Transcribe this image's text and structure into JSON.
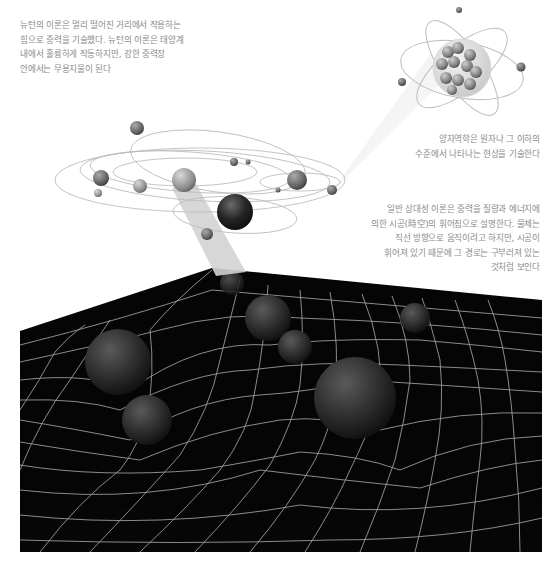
{
  "captions": {
    "newton": {
      "lines": [
        "뉴턴의 이론은 멀리 떨어진 거리에서 작용하는",
        "힘으로 중력을 기술했다. 뉴턴의 이론은 태양계",
        "내에서 훌륭하게 작동하지만, 강한 중력장",
        "안에서는 무용지물이 된다"
      ]
    },
    "quantum": {
      "lines": [
        "양자역학은 원자나 그 이하의",
        "수준에서 나타나는 현상을 기술한다"
      ]
    },
    "relativity": {
      "lines": [
        "일반 상대성 이론은 중력을 질량과 에너지에",
        "의한 시공(時空)의 휘어짐으로 설명한다. 물체는",
        "직선 방향으로 움직이려고 하지만, 시공이",
        "휘어져 있기 때문에 그 경로는 구부러져 있는",
        "것처럼 보인다"
      ]
    }
  },
  "illustrations": {
    "atom": {
      "label": "atom",
      "nucleus_color": "#9a9a9a"
    },
    "solar_system": {
      "label": "solar-system"
    },
    "spacetime_grid": {
      "label": "curved-spacetime-grid",
      "background": "#060606",
      "grid_color": "#bdbdbd"
    }
  },
  "colors": {
    "text": "#8a8a8a",
    "beam": "#d6d6d6",
    "orbit": "#bbbbbb"
  }
}
